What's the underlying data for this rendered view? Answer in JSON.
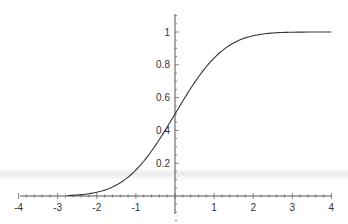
{
  "chart_data": {
    "type": "line",
    "title": "",
    "xlabel": "",
    "ylabel": "",
    "xlim": [
      -4,
      4
    ],
    "ylim": [
      0,
      1.1
    ],
    "grid": false,
    "legend": null,
    "x_ticks": [
      "-4",
      "-3",
      "-2",
      "-1",
      "0",
      "1",
      "2",
      "3",
      "4"
    ],
    "y_ticks": [
      "0.2",
      "0.4",
      "0.6",
      "0.8",
      "1"
    ],
    "series": [
      {
        "name": "normal CDF",
        "x": [
          -4,
          -3.5,
          -3,
          -2.75,
          -2.5,
          -2.25,
          -2,
          -1.75,
          -1.5,
          -1.25,
          -1,
          -0.75,
          -0.5,
          -0.25,
          0,
          0.25,
          0.5,
          0.75,
          1,
          1.25,
          1.5,
          1.75,
          2,
          2.25,
          2.5,
          2.75,
          3,
          3.5,
          4
        ],
        "values": [
          0.0,
          0.0,
          0.001,
          0.003,
          0.006,
          0.012,
          0.023,
          0.04,
          0.067,
          0.106,
          0.159,
          0.227,
          0.309,
          0.401,
          0.5,
          0.599,
          0.691,
          0.773,
          0.841,
          0.894,
          0.933,
          0.96,
          0.977,
          0.988,
          0.994,
          0.997,
          0.999,
          1.0,
          1.0
        ],
        "color": "#333333",
        "x_start": -2.75
      }
    ]
  },
  "layout": {
    "origin_px": [
      175,
      196
    ],
    "x_unit_px": 39.1,
    "y_unit_px": 164,
    "x_axis_range_px": [
      20,
      332
    ],
    "y_axis_range_px": [
      14,
      214
    ]
  }
}
